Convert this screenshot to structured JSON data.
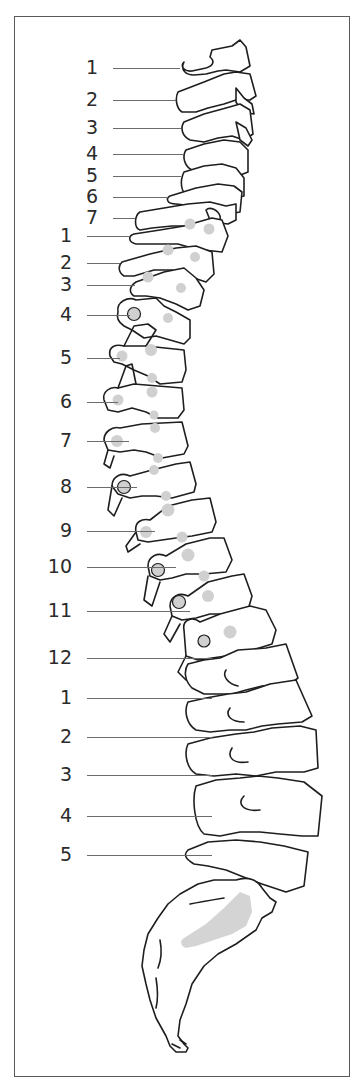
{
  "figure": {
    "colors": {
      "outline": "#1e1e1e",
      "facet_fill": "#d0d0d0",
      "frame": "#5a5a5a",
      "label": "#2b2b2b",
      "leader": "#6b6b6b"
    }
  },
  "groups": {
    "cervical": {
      "labels": [
        {
          "text": "1",
          "y": 68,
          "line_end": 180
        },
        {
          "text": "2",
          "y": 100,
          "line_end": 176
        },
        {
          "text": "3",
          "y": 128,
          "line_end": 181
        },
        {
          "text": "4",
          "y": 154,
          "line_end": 184
        },
        {
          "text": "5",
          "y": 176,
          "line_end": 181
        },
        {
          "text": "6",
          "y": 197,
          "line_end": 168
        },
        {
          "text": "7",
          "y": 218,
          "line_end": 135
        }
      ]
    },
    "thoracic": {
      "labels": [
        {
          "text": "1",
          "y": 236,
          "line_end": 130
        },
        {
          "text": "2",
          "y": 263,
          "line_end": 120
        },
        {
          "text": "3",
          "y": 285,
          "line_end": 135
        },
        {
          "text": "4",
          "y": 315,
          "line_end": 130
        },
        {
          "text": "5",
          "y": 358,
          "line_end": 120
        },
        {
          "text": "6",
          "y": 402,
          "line_end": 118
        },
        {
          "text": "7",
          "y": 441,
          "line_end": 129
        },
        {
          "text": "8",
          "y": 487,
          "line_end": 137
        },
        {
          "text": "9",
          "y": 531,
          "line_end": 155
        },
        {
          "text": "10",
          "y": 567,
          "line_end": 176
        },
        {
          "text": "11",
          "y": 611,
          "line_end": 190
        },
        {
          "text": "12",
          "y": 658,
          "line_end": 212
        }
      ]
    },
    "lumbar": {
      "labels": [
        {
          "text": "1",
          "y": 698,
          "line_end": 212
        },
        {
          "text": "2",
          "y": 737,
          "line_end": 212
        },
        {
          "text": "3",
          "y": 775,
          "line_end": 212
        },
        {
          "text": "4",
          "y": 816,
          "line_end": 212
        },
        {
          "text": "5",
          "y": 855,
          "line_end": 212
        }
      ]
    }
  }
}
